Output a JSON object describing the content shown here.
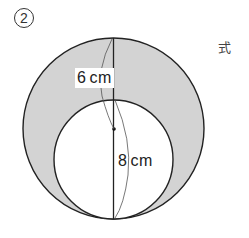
{
  "problem": {
    "number_label": "2",
    "formula_label": "式"
  },
  "figure": {
    "type": "circles",
    "outer_circle": {
      "cx": 113.5,
      "cy": 128.5,
      "r": 90.5
    },
    "inner_circle": {
      "cx": 113.5,
      "cy": 159.5,
      "r": 59.5
    },
    "shaded_fill": "#d3d3d3",
    "stroke_color": "#222222",
    "center_dot": {
      "cx": 114,
      "cy": 129
    }
  },
  "dimensions": {
    "outer_segment": {
      "value": "6",
      "unit": "cm"
    },
    "inner_segment": {
      "value": "8",
      "unit": "cm"
    }
  }
}
